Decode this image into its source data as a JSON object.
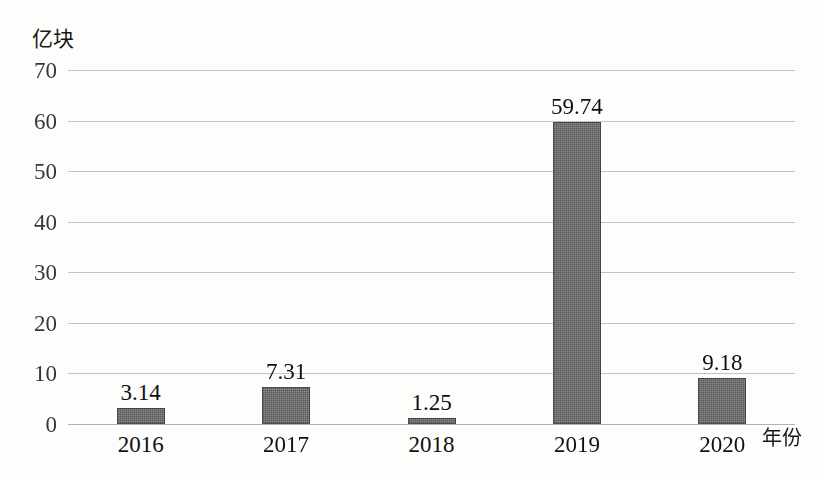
{
  "chart_data": {
    "type": "bar",
    "title": "",
    "xlabel": "年份",
    "ylabel": "亿块",
    "categories": [
      "2016",
      "2017",
      "2018",
      "2019",
      "2020"
    ],
    "values": [
      3.14,
      7.31,
      1.25,
      59.74,
      9.18
    ],
    "value_labels": [
      "3.14",
      "7.31",
      "1.25",
      "59.74",
      "9.18"
    ],
    "ylim": [
      0,
      70
    ],
    "ytick_labels": [
      "70",
      "60",
      "50",
      "40",
      "30",
      "20",
      "10",
      "0"
    ],
    "ytick_values": [
      70,
      60,
      50,
      40,
      30,
      20,
      10,
      0
    ],
    "grid": true,
    "legend": "none",
    "bar_color": "#585858",
    "gridline_color": "#b9b9b9",
    "background_color": "#fdfdfc"
  }
}
